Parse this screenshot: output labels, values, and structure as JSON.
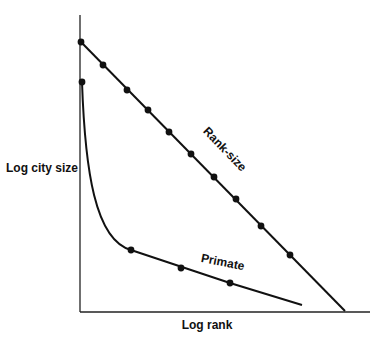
{
  "diagram": {
    "type": "line",
    "y_axis_label": "Log city size",
    "x_axis_label": "Log rank",
    "series": [
      {
        "name": "Rank-size",
        "label": "Rank-size",
        "shape": "straight line",
        "points_px": [
          [
            81,
            42
          ],
          [
            103,
            65
          ],
          [
            127,
            90
          ],
          [
            148,
            110
          ],
          [
            169,
            132
          ],
          [
            191,
            154
          ],
          [
            214,
            177
          ],
          [
            236,
            199
          ],
          [
            261,
            226
          ],
          [
            290,
            255
          ]
        ],
        "end_px": [
          345,
          311
        ]
      },
      {
        "name": "Primate",
        "label": "Primate",
        "shape": "steep concave curve then shallow line",
        "points_px": [
          [
            82,
            82
          ],
          [
            131,
            250
          ],
          [
            181,
            268
          ],
          [
            230,
            283
          ]
        ],
        "end_px": [
          302,
          305
        ]
      }
    ]
  },
  "chart_data": {
    "type": "line",
    "title": "",
    "xlabel": "Log rank",
    "ylabel": "Log city size",
    "grid": false,
    "series": [
      {
        "name": "Rank-size",
        "x": [
          0,
          0.08,
          0.16,
          0.23,
          0.3,
          0.38,
          0.46,
          0.54,
          0.62,
          0.72
        ],
        "y": [
          0.9,
          0.82,
          0.74,
          0.67,
          0.6,
          0.52,
          0.44,
          0.37,
          0.28,
          0.19
        ]
      },
      {
        "name": "Primate",
        "x": [
          0,
          0.18,
          0.35,
          0.52
        ],
        "y": [
          0.77,
          0.21,
          0.15,
          0.1
        ]
      }
    ]
  }
}
